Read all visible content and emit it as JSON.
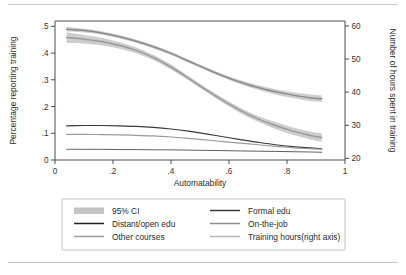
{
  "figure": {
    "background": "#ffffff",
    "frame_color": "#3a3a3a"
  },
  "chart_data": {
    "type": "line",
    "title": "",
    "xlabel": "Automatability",
    "ylabel": "Percentage reporting training",
    "y2label": "Number of hours spent in training",
    "xlim": [
      0,
      1
    ],
    "ylim": [
      0,
      0.52
    ],
    "y2lim": [
      19.5,
      61.5
    ],
    "grid": false,
    "xticks": [
      0,
      0.2,
      0.4,
      0.6,
      0.8,
      1
    ],
    "xticklabels": [
      "0",
      ".2",
      ".4",
      ".6",
      ".8",
      "1"
    ],
    "yticks": [
      0,
      0.1,
      0.2,
      0.3,
      0.4,
      0.5
    ],
    "yticklabels": [
      "0",
      ".1",
      ".2",
      ".3",
      ".4",
      ".5"
    ],
    "y2ticks": [
      20,
      30,
      40,
      50,
      60
    ],
    "y2ticklabels": [
      "20",
      "30",
      "40",
      "50",
      "60"
    ],
    "x": [
      0.04,
      0.1,
      0.16,
      0.22,
      0.28,
      0.34,
      0.4,
      0.46,
      0.52,
      0.58,
      0.64,
      0.7,
      0.76,
      0.82,
      0.88,
      0.92
    ],
    "series": [
      {
        "name": "Training hours(right axis)",
        "axis": "right",
        "color": "#8c8c8c",
        "width": 1.5,
        "values": [
          59.0,
          58.6,
          57.9,
          56.8,
          55.4,
          53.7,
          51.7,
          49.4,
          47.1,
          44.9,
          43.0,
          41.4,
          40.1,
          39.1,
          38.3,
          38.0
        ],
        "ci_lower": [
          58.3,
          58.0,
          57.4,
          56.3,
          54.9,
          53.2,
          51.2,
          48.9,
          46.6,
          44.4,
          42.4,
          40.7,
          39.3,
          38.2,
          37.3,
          37.0
        ],
        "ci_upper": [
          59.7,
          59.2,
          58.4,
          57.3,
          55.9,
          54.2,
          52.2,
          49.9,
          47.6,
          45.4,
          43.6,
          42.1,
          40.9,
          40.0,
          39.3,
          39.0
        ]
      },
      {
        "name": "On-the-job",
        "axis": "left",
        "color": "#9a9a9a",
        "width": 1.5,
        "values": [
          0.458,
          0.452,
          0.443,
          0.429,
          0.41,
          0.383,
          0.348,
          0.306,
          0.263,
          0.222,
          0.185,
          0.154,
          0.129,
          0.108,
          0.092,
          0.084
        ],
        "ci_lower": [
          0.438,
          0.436,
          0.429,
          0.417,
          0.399,
          0.373,
          0.339,
          0.298,
          0.255,
          0.213,
          0.175,
          0.143,
          0.116,
          0.094,
          0.077,
          0.068
        ],
        "ci_upper": [
          0.478,
          0.468,
          0.457,
          0.441,
          0.421,
          0.393,
          0.357,
          0.314,
          0.271,
          0.231,
          0.195,
          0.165,
          0.142,
          0.122,
          0.107,
          0.1
        ]
      },
      {
        "name": "Formal edu",
        "axis": "left",
        "color": "#3a3a3a",
        "width": 1.2,
        "values": [
          0.128,
          0.129,
          0.129,
          0.128,
          0.126,
          0.122,
          0.116,
          0.108,
          0.098,
          0.087,
          0.076,
          0.066,
          0.057,
          0.05,
          0.045,
          0.042
        ]
      },
      {
        "name": "Other courses",
        "axis": "left",
        "color": "#9a9a9a",
        "width": 1.2,
        "values": [
          0.096,
          0.096,
          0.095,
          0.094,
          0.092,
          0.09,
          0.086,
          0.081,
          0.075,
          0.069,
          0.063,
          0.057,
          0.051,
          0.046,
          0.042,
          0.04
        ]
      },
      {
        "name": "Distant/open edu",
        "axis": "left",
        "color": "#5e5e5e",
        "width": 1.0,
        "values": [
          0.04,
          0.04,
          0.04,
          0.039,
          0.039,
          0.038,
          0.038,
          0.037,
          0.036,
          0.035,
          0.034,
          0.033,
          0.032,
          0.031,
          0.03,
          0.029
        ]
      }
    ],
    "ci_color": "#c4c4c4",
    "ci_label": "95% CI",
    "legend": {
      "position": "below",
      "entries": [
        {
          "label": "95% CI",
          "swatch": "band",
          "color": "#c4c4c4"
        },
        {
          "label": "Formal edu",
          "swatch": "line",
          "color": "#3a3a3a"
        },
        {
          "label": "Distant/open edu",
          "swatch": "line",
          "color": "#1f1f1f"
        },
        {
          "label": "On-the-job",
          "swatch": "line",
          "color": "#8c8c8c"
        },
        {
          "label": "Other courses",
          "swatch": "line",
          "color": "#9a9a9a"
        },
        {
          "label": "Training hours(right axis)",
          "swatch": "line",
          "color": "#b6b6b6"
        }
      ]
    }
  }
}
